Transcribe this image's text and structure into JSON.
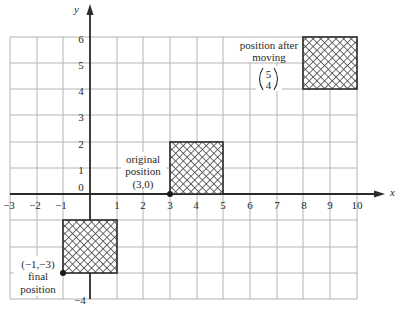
{
  "diagram": {
    "axes": {
      "x": {
        "name": "x",
        "range": [
          -3,
          10
        ],
        "tick_labels": [
          "−3",
          "−2",
          "−1",
          "1",
          "2",
          "3",
          "4",
          "5",
          "6",
          "7",
          "8",
          "9",
          "10"
        ]
      },
      "y": {
        "name": "y",
        "range": [
          -4,
          6
        ],
        "tick_labels": [
          "6",
          "5",
          "4",
          "3",
          "2",
          "1",
          "0",
          "−4"
        ]
      },
      "grid": true
    },
    "shapes": [
      {
        "name": "original square",
        "x": [
          3,
          5
        ],
        "y": [
          0,
          2
        ],
        "fill": "crosshatch"
      },
      {
        "name": "square after moving",
        "x": [
          8,
          10
        ],
        "y": [
          4,
          6
        ],
        "fill": "crosshatch"
      },
      {
        "name": "final square",
        "x": [
          -1,
          1
        ],
        "y": [
          -3,
          -1
        ],
        "fill": "crosshatch"
      }
    ],
    "points": [
      {
        "label": "(3,0)",
        "x": 3,
        "y": 0
      },
      {
        "label": "(−1,−3)",
        "x": -1,
        "y": -3
      }
    ],
    "annotations": {
      "original": {
        "line1": "original",
        "line2": "position",
        "coord": "(3,0)"
      },
      "after": {
        "line1": "position after",
        "line2": "moving",
        "vector_top": "5",
        "vector_bottom": "4"
      },
      "final": {
        "coord": "(−1,−3)",
        "line1": "final",
        "line2": "position"
      }
    },
    "colors": {
      "grid": "#b4b4b4",
      "axis": "#2a2a2a",
      "hatch": "#555555"
    }
  }
}
